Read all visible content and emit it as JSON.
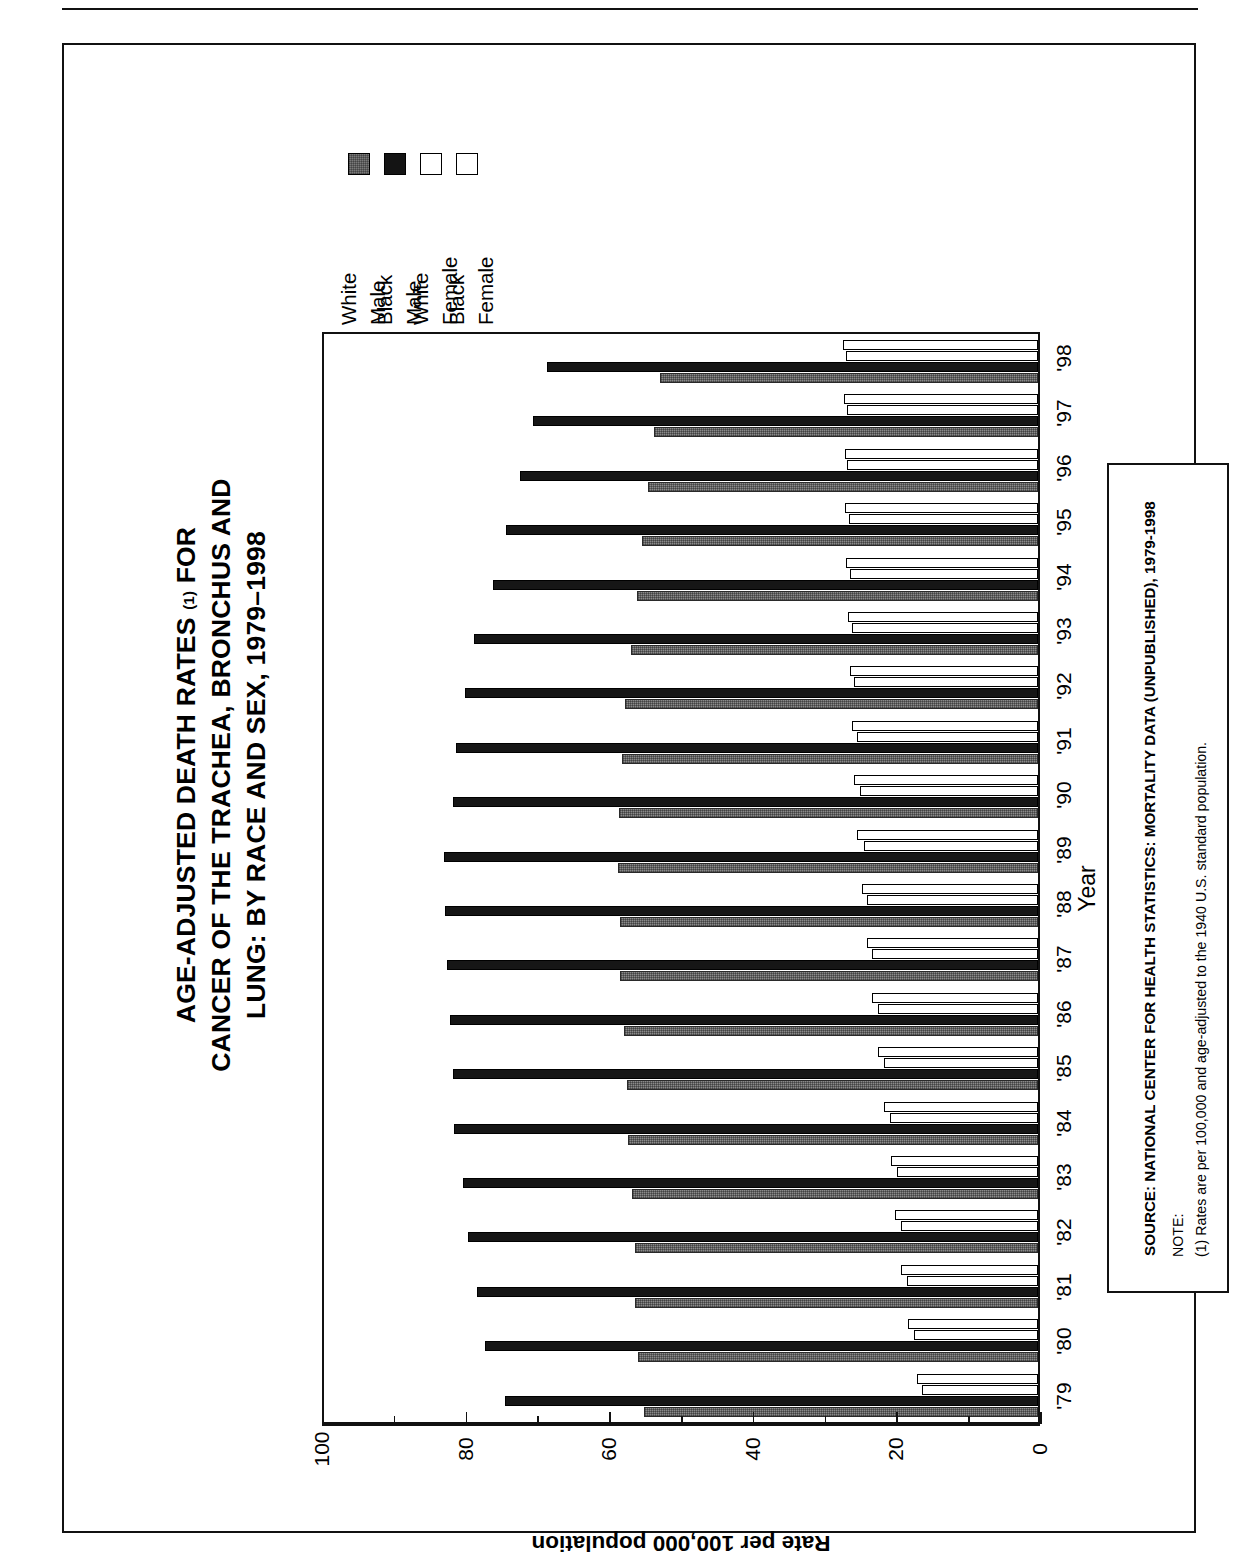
{
  "figure": {
    "title_lines": [
      "AGE-ADJUSTED DEATH RATES (1) FOR",
      "CANCER OF THE TRACHEA, BRONCHUS AND",
      "LUNG: BY RACE AND SEX, 1979–1998"
    ],
    "title_line1_main": "AGE-ADJUSTED DEATH RATES",
    "title_superscript": "(1)",
    "title_line1_tail": "FOR",
    "title_line2": "CANCER OF THE TRACHEA, BRONCHUS AND",
    "title_line3": "LUNG: BY RACE AND SEX, 1979–1998"
  },
  "legend": {
    "items": [
      {
        "race": "White",
        "sex": "Male",
        "swatch": "gray-hatch-swatch",
        "color": "#7a7a7a"
      },
      {
        "race": "Black",
        "sex": "Male",
        "swatch": "black-swatch",
        "color": "#141414"
      },
      {
        "race": "White",
        "sex": "Female",
        "swatch": "white-swatch",
        "color": "#ffffff"
      },
      {
        "race": "Black",
        "sex": "Female",
        "swatch": "white-swatch",
        "color": "#ffffff"
      }
    ]
  },
  "axes": {
    "value_axis_title": "Rate per 100,000 population",
    "value_ticks": [
      "0",
      "20",
      "40",
      "60",
      "80",
      "100"
    ],
    "value_min": 0,
    "value_max": 100,
    "category_axis_title": "Year"
  },
  "source_box": {
    "source": "SOURCE: NATIONAL CENTER FOR HEALTH STATISTICS: MORTALITY DATA (UNPUBLISHED), 1979-1998",
    "note_label": "NOTE:",
    "note_text": "(1) Rates are per 100,000 and age-adjusted to the 1940 U.S. standard population."
  },
  "chart_data": {
    "type": "bar",
    "orientation": "horizontal",
    "title": "AGE-ADJUSTED DEATH RATES (1) FOR CANCER OF THE TRACHEA, BRONCHUS AND LUNG: BY RACE AND SEX, 1979–1998",
    "xlabel": "Year",
    "ylabel": "Rate per 100,000 population",
    "ylim": [
      0,
      100
    ],
    "grid": false,
    "legend_position": "top-left",
    "categories": [
      "'79",
      "'80",
      "'81",
      "'82",
      "'83",
      "'84",
      "'85",
      "'86",
      "'87",
      "'88",
      "'89",
      "'90",
      "'91",
      "'92",
      "'93",
      "'94",
      "'95",
      "'96",
      "'97",
      "'98"
    ],
    "series": [
      {
        "name": "White Male",
        "color": "#7a7a7a",
        "values": [
          55.2,
          56.0,
          56.4,
          56.5,
          56.8,
          57.4,
          57.6,
          58.0,
          58.5,
          58.6,
          58.8,
          58.7,
          58.2,
          57.8,
          57.0,
          56.2,
          55.4,
          54.6,
          53.8,
          53.0
        ]
      },
      {
        "name": "Black Male",
        "color": "#141414",
        "values": [
          74.6,
          77.5,
          78.6,
          79.8,
          80.6,
          81.8,
          81.9,
          82.4,
          82.8,
          83.0,
          83.2,
          82.0,
          81.5,
          80.2,
          79.0,
          76.4,
          74.5,
          72.6,
          70.8,
          68.8
        ]
      },
      {
        "name": "White Female",
        "color": "#ffffff",
        "values": [
          17.0,
          18.2,
          19.2,
          20.0,
          20.6,
          21.6,
          22.4,
          23.2,
          24.0,
          24.7,
          25.3,
          25.8,
          26.1,
          26.4,
          26.6,
          26.9,
          27.0,
          27.1,
          27.2,
          27.3
        ]
      },
      {
        "name": "Black Female",
        "color": "#ffffff",
        "values": [
          16.2,
          17.4,
          18.4,
          19.2,
          19.8,
          20.8,
          21.6,
          22.4,
          23.2,
          23.9,
          24.4,
          25.0,
          25.4,
          25.8,
          26.0,
          26.3,
          26.5,
          26.7,
          26.8,
          26.9
        ]
      }
    ]
  }
}
